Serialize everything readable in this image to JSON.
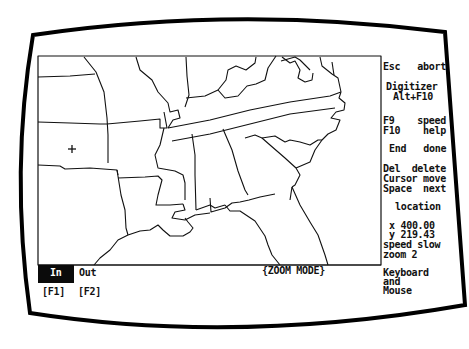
{
  "app": {
    "mode_label": "{ZOOM MODE}"
  },
  "sidebar": {
    "esc": {
      "key": "Esc",
      "action": "abort"
    },
    "digitizer": {
      "label": "Digitizer",
      "shortcut": "Alt+F10"
    },
    "f9": {
      "key": "F9",
      "action": "speed"
    },
    "f10": {
      "key": "F10",
      "action": "help"
    },
    "end": {
      "key": "End",
      "action": "done"
    },
    "del": {
      "key": "Del",
      "action": "delete"
    },
    "cursor": {
      "key": "Cursor",
      "action": "move"
    },
    "space": {
      "key": "Space",
      "action": "next"
    },
    "location": {
      "title": "location",
      "x": "x 400.00",
      "y": "y 219.43",
      "speed": "speed slow",
      "zoom": "zoom 2"
    },
    "input_mode": {
      "line1": "Keyboard",
      "line2": "and",
      "line3": "Mouse"
    }
  },
  "bottom_bar": {
    "zoom_in": {
      "label": "In",
      "key": "[F1]",
      "selected": true
    },
    "zoom_out": {
      "label": "Out",
      "key": "[F2]",
      "selected": false
    }
  },
  "map": {
    "region": "Southeastern United States",
    "cursor_icon": "crosshair-cursor-icon"
  },
  "colors": {
    "ink": "#111111",
    "background": "#ffffff",
    "selected_bg": "#0b0b0b"
  }
}
